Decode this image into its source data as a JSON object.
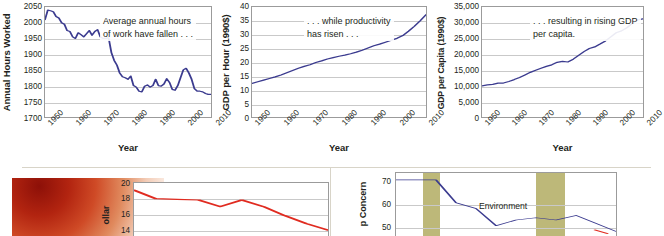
{
  "figure": {
    "divider_color": "#d8d4c8",
    "line_color_navy": "#3b3b8f",
    "line_color_red": "#e02b20",
    "band_color": "#bdb879"
  },
  "charts": [
    {
      "id": "annual-hours-worked",
      "annotation": [
        "Average annual hours",
        "of work have fallen . . ."
      ],
      "ylabel": "Annual Hours Worked",
      "xlabel": "Year",
      "yticks": [
        "2050",
        "2000",
        "1950",
        "1900",
        "1850",
        "1800",
        "1750",
        "1700"
      ],
      "xticks": [
        "1950",
        "1960",
        "1970",
        "1980",
        "1990",
        "2000",
        "2010"
      ]
    },
    {
      "id": "gdp-per-hour",
      "annotation": [
        ". . . while productivity",
        "has risen . . ."
      ],
      "ylabel": "GDP per Hour (1990$)",
      "xlabel": "Year",
      "yticks": [
        "40",
        "35",
        "30",
        "25",
        "20",
        "15",
        "10",
        "5",
        "0"
      ],
      "xticks": [
        "1950",
        "1960",
        "1970",
        "1980",
        "1990",
        "2000",
        "2010"
      ]
    },
    {
      "id": "gdp-per-capita",
      "annotation": [
        ". . . resulting in rising GDP",
        "per capita."
      ],
      "ylabel": "GDP per Capita (1990$)",
      "xlabel": "Year",
      "yticks": [
        "35,000",
        "30,000",
        "25,000",
        "20,000",
        "15,000",
        "10,000",
        "5,000",
        "0"
      ],
      "xticks": [
        "1950",
        "1960",
        "1970",
        "1980",
        "1990",
        "2000",
        "2010"
      ]
    }
  ],
  "bottom_left": {
    "ylabel": "ollar",
    "ylabel2": "$)",
    "yticks": [
      "20",
      "18",
      "16",
      "14"
    ]
  },
  "bottom_right": {
    "ylabel": "p Concern",
    "yticks": [
      "70",
      "60",
      "50"
    ],
    "series_label": "Environment"
  },
  "chart_data": [
    {
      "type": "line",
      "id": "annual-hours-worked",
      "title": "Average annual hours of work have fallen . . .",
      "xlabel": "Year",
      "ylabel": "Annual Hours Worked",
      "xlim": [
        1950,
        2010
      ],
      "ylim": [
        1700,
        2050
      ],
      "yticks": [
        1700,
        1750,
        1800,
        1850,
        1900,
        1950,
        2000,
        2050
      ],
      "xticks": [
        1950,
        1960,
        1970,
        1980,
        1990,
        2000,
        2010
      ],
      "grid": true,
      "legend": "none",
      "color": "#3b3b8f",
      "x": [
        1950,
        1951,
        1952,
        1953,
        1954,
        1955,
        1956,
        1957,
        1958,
        1959,
        1960,
        1961,
        1962,
        1963,
        1964,
        1965,
        1966,
        1967,
        1968,
        1969,
        1970,
        1971,
        1972,
        1973,
        1974,
        1975,
        1976,
        1977,
        1978,
        1979,
        1980,
        1981,
        1982,
        1983,
        1984,
        1985,
        1986,
        1987,
        1988,
        1989,
        1990,
        1991,
        1992,
        1993,
        1994,
        1995,
        1996,
        1997,
        1998,
        1999,
        2000,
        2001,
        2002,
        2003,
        2004,
        2005,
        2006,
        2007,
        2008,
        2009,
        2010
      ],
      "y": [
        2010,
        2040,
        2038,
        2035,
        2020,
        2015,
        2000,
        1995,
        1975,
        1972,
        1955,
        1950,
        1968,
        1962,
        1955,
        1965,
        1975,
        1960,
        1972,
        1978,
        1955,
        1950,
        1950,
        1952,
        1905,
        1880,
        1865,
        1840,
        1828,
        1825,
        1820,
        1830,
        1800,
        1795,
        1782,
        1780,
        1798,
        1802,
        1795,
        1800,
        1820,
        1800,
        1798,
        1805,
        1822,
        1810,
        1788,
        1785,
        1800,
        1825,
        1850,
        1855,
        1840,
        1820,
        1790,
        1782,
        1782,
        1780,
        1775,
        1772,
        1772
      ]
    },
    {
      "type": "line",
      "id": "gdp-per-hour",
      "title": ". . . while productivity has risen . . .",
      "xlabel": "Year",
      "ylabel": "GDP per Hour (1990$)",
      "xlim": [
        1950,
        2010
      ],
      "ylim": [
        0,
        40
      ],
      "yticks": [
        0,
        5,
        10,
        15,
        20,
        25,
        30,
        35,
        40
      ],
      "xticks": [
        1950,
        1960,
        1970,
        1980,
        1990,
        2000,
        2010
      ],
      "grid": true,
      "legend": "none",
      "color": "#3b3b8f",
      "x": [
        1950,
        1952,
        1954,
        1956,
        1958,
        1960,
        1962,
        1964,
        1966,
        1968,
        1970,
        1972,
        1974,
        1976,
        1978,
        1980,
        1982,
        1984,
        1986,
        1988,
        1990,
        1992,
        1994,
        1996,
        1998,
        2000,
        2002,
        2004,
        2006,
        2008,
        2010
      ],
      "y": [
        12.2,
        12.8,
        13.4,
        14.0,
        14.6,
        15.3,
        16.1,
        16.9,
        17.7,
        18.4,
        19.0,
        19.8,
        20.4,
        21.1,
        21.6,
        22.1,
        22.5,
        23.0,
        23.6,
        24.3,
        25.1,
        25.9,
        26.5,
        27.2,
        27.9,
        28.6,
        29.6,
        31.2,
        33.0,
        35.0,
        37.2
      ]
    },
    {
      "type": "line",
      "id": "gdp-per-capita",
      "title": ". . . resulting in rising GDP per capita.",
      "xlabel": "Year",
      "ylabel": "GDP per Capita (1990$)",
      "xlim": [
        1950,
        2010
      ],
      "ylim": [
        0,
        35000
      ],
      "yticks": [
        0,
        5000,
        10000,
        15000,
        20000,
        25000,
        30000,
        35000
      ],
      "xticks": [
        1950,
        1960,
        1970,
        1980,
        1990,
        2000,
        2010
      ],
      "grid": true,
      "legend": "none",
      "color": "#3b3b8f",
      "x": [
        1950,
        1952,
        1954,
        1956,
        1958,
        1960,
        1962,
        1964,
        1966,
        1968,
        1970,
        1972,
        1974,
        1976,
        1978,
        1980,
        1982,
        1984,
        1986,
        1988,
        1990,
        1992,
        1994,
        1996,
        1998,
        2000,
        2002,
        2004,
        2006,
        2008,
        2010
      ],
      "y": [
        9900,
        10200,
        10400,
        10800,
        10800,
        11300,
        11900,
        12600,
        13400,
        14200,
        14900,
        15500,
        16100,
        16600,
        17400,
        17700,
        17500,
        18400,
        19600,
        20800,
        21800,
        22300,
        23200,
        24200,
        25500,
        26800,
        27400,
        28400,
        29800,
        30900,
        31200
      ]
    },
    {
      "type": "line",
      "id": "bottom-left-dollar",
      "title": "",
      "ylabel": "ollar ($)",
      "ylim": [
        14,
        20
      ],
      "yticks": [
        14,
        16,
        18,
        20
      ],
      "grid": true,
      "legend": "none",
      "color": "#e02b20",
      "x": [
        0,
        1,
        2,
        3,
        4,
        5,
        6,
        7,
        8,
        9
      ],
      "y": [
        19.5,
        18.2,
        18.1,
        18.0,
        17.0,
        18.0,
        17.0,
        15.6,
        14.4,
        13.4
      ]
    },
    {
      "type": "line",
      "id": "bottom-right-concern",
      "title": "",
      "ylabel": "p Concern",
      "ylim": [
        45,
        70
      ],
      "yticks": [
        50,
        60,
        70
      ],
      "grid": true,
      "legend": "Environment",
      "color": "#3b3b8f",
      "x": [
        0,
        1,
        2,
        3,
        4,
        5,
        6,
        7,
        8,
        9,
        10,
        11
      ],
      "y": [
        68.5,
        68.5,
        68.5,
        58.5,
        56.0,
        48.5,
        51.0,
        52.0,
        51.0,
        53.0,
        49.5,
        46.0
      ]
    }
  ]
}
